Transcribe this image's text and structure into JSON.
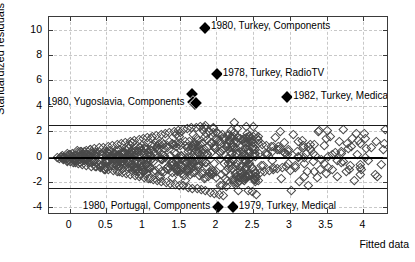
{
  "figure": {
    "title": "",
    "background": "#ffffff"
  },
  "axes": {
    "xlabel": "Fitted data",
    "ylabel": "Standardized residuals",
    "xlim": [
      -0.28,
      4.35
    ],
    "ylim": [
      -4.6,
      11.0
    ],
    "xticks": [
      0,
      0.5,
      1,
      1.5,
      2,
      2.5,
      3,
      3.5,
      4
    ],
    "xticklabels": [
      "0",
      "0.5",
      "1",
      "1.5",
      "2",
      "2.5",
      "3",
      "3.5",
      "4"
    ],
    "yticks": [
      -4,
      -2,
      0,
      2,
      4,
      6,
      8,
      10
    ],
    "yticklabels": [
      "-4",
      "-2",
      "0",
      "2",
      "4",
      "6",
      "8",
      "10"
    ],
    "grid": true,
    "grid_style": "dashed",
    "grid_color": "#c8c8c8",
    "frame_color": "#3a3a3a"
  },
  "reference_lines": [
    {
      "name": "upper-threshold",
      "y": 2.5,
      "color": "#1a1a1a",
      "width": 1
    },
    {
      "name": "zero-line",
      "y": 0,
      "color": "#000000",
      "width": 2.4
    },
    {
      "name": "lower-threshold",
      "y": -2.5,
      "color": "#1a1a1a",
      "width": 1
    }
  ],
  "annotations": [
    {
      "id": "a1",
      "text": "1980, Turkey, Components",
      "x": 1.83,
      "y": 10.25,
      "marker": "filled-diamond",
      "label_side": "right"
    },
    {
      "id": "a2",
      "text": "1978, Turkey, RadioTV",
      "x": 1.99,
      "y": 6.55,
      "marker": "filled-diamond",
      "label_side": "right"
    },
    {
      "id": "a3",
      "text": "1982, Turkey, Medical",
      "x": 2.95,
      "y": 4.75,
      "marker": "filled-diamond",
      "label_side": "right"
    },
    {
      "id": "a4",
      "text": "1980, Yugoslavia, Components",
      "x": 1.66,
      "y": 4.3,
      "marker": "none",
      "label_side": "left"
    },
    {
      "id": "a5",
      "text": "1980, Portugal, Components",
      "x": 2.01,
      "y": -3.9,
      "marker": "filled-diamond",
      "label_side": "left"
    },
    {
      "id": "a6",
      "text": "1979, Turkey, Medical",
      "x": 2.21,
      "y": -3.9,
      "marker": "filled-diamond",
      "label_side": "right"
    }
  ],
  "chart_data": {
    "type": "scatter",
    "title": "",
    "xlabel": "Fitted data",
    "ylabel": "Standardized residuals",
    "xlim": [
      -0.28,
      4.35
    ],
    "ylim": [
      -4.6,
      11.0
    ],
    "grid": true,
    "legend": null,
    "marker": "open-diamond",
    "marker_color": "#4a4a4a",
    "series": [
      {
        "name": "residuals",
        "description": "Standardized residuals versus fitted data; dense funnel-shaped cloud widening with fitted value, centered on zero, bounded mostly within +/-2.5, with six labelled outliers.",
        "n_points_approx": 620,
        "highlighted_points": [
          {
            "x": 1.83,
            "y": 10.25,
            "label": "1980, Turkey, Components"
          },
          {
            "x": 1.99,
            "y": 6.55,
            "label": "1978, Turkey, RadioTV"
          },
          {
            "x": 2.95,
            "y": 4.75,
            "label": "1982, Turkey, Medical"
          },
          {
            "x": 1.66,
            "y": 5.0,
            "label": "1980, Yugoslavia, Components"
          },
          {
            "x": 1.67,
            "y": 4.3,
            "label": "1980, Yugoslavia, Components"
          },
          {
            "x": 1.69,
            "y": 4.2,
            "label": "1980, Yugoslavia, Components"
          },
          {
            "x": 2.01,
            "y": -3.9,
            "label": "1980, Portugal, Components"
          },
          {
            "x": 2.21,
            "y": -3.9,
            "label": "1979, Turkey, Medical"
          }
        ],
        "points": [
          [
            -0.18,
            0.02
          ],
          [
            -0.15,
            -0.05
          ],
          [
            -0.12,
            0.1
          ],
          [
            -0.1,
            -0.12
          ],
          [
            -0.08,
            0.06
          ],
          [
            -0.05,
            0.18
          ],
          [
            -0.04,
            -0.2
          ],
          [
            -0.02,
            0.25
          ],
          [
            0.0,
            -0.28
          ],
          [
            0.01,
            0.12
          ],
          [
            0.03,
            0.33
          ],
          [
            0.04,
            -0.35
          ],
          [
            0.06,
            0.08
          ],
          [
            0.07,
            -0.18
          ],
          [
            0.09,
            0.4
          ],
          [
            0.1,
            -0.42
          ],
          [
            0.12,
            0.22
          ],
          [
            0.13,
            -0.1
          ],
          [
            0.15,
            0.48
          ],
          [
            0.16,
            -0.5
          ],
          [
            0.18,
            0.3
          ],
          [
            0.19,
            -0.25
          ],
          [
            0.21,
            0.55
          ],
          [
            0.22,
            -0.58
          ],
          [
            0.24,
            0.15
          ],
          [
            0.25,
            -0.33
          ],
          [
            0.27,
            0.62
          ],
          [
            0.28,
            -0.65
          ],
          [
            0.3,
            0.38
          ],
          [
            0.31,
            -0.2
          ],
          [
            0.33,
            0.7
          ],
          [
            0.34,
            -0.72
          ],
          [
            0.36,
            0.45
          ],
          [
            0.37,
            -0.4
          ],
          [
            0.39,
            0.78
          ],
          [
            0.4,
            -0.8
          ],
          [
            0.42,
            0.28
          ],
          [
            0.43,
            -0.55
          ],
          [
            0.45,
            0.85
          ],
          [
            0.46,
            -0.88
          ],
          [
            0.48,
            0.52
          ],
          [
            0.49,
            -0.3
          ],
          [
            0.51,
            0.92
          ],
          [
            0.52,
            -0.95
          ],
          [
            0.54,
            0.6
          ],
          [
            0.55,
            -0.62
          ],
          [
            0.57,
            1.0
          ],
          [
            0.58,
            -1.02
          ],
          [
            0.6,
            0.35
          ],
          [
            0.61,
            -0.45
          ],
          [
            0.63,
            1.08
          ],
          [
            0.64,
            -1.1
          ],
          [
            0.66,
            0.68
          ],
          [
            0.67,
            -0.7
          ],
          [
            0.69,
            1.15
          ],
          [
            0.7,
            -1.18
          ],
          [
            0.72,
            0.42
          ],
          [
            0.73,
            -0.52
          ],
          [
            0.75,
            1.22
          ],
          [
            0.76,
            -1.25
          ],
          [
            0.78,
            0.75
          ],
          [
            0.79,
            -0.78
          ],
          [
            0.81,
            1.3
          ],
          [
            0.82,
            -1.32
          ],
          [
            0.84,
            0.5
          ],
          [
            0.85,
            -0.6
          ],
          [
            0.87,
            1.38
          ],
          [
            0.88,
            -1.4
          ],
          [
            0.9,
            0.82
          ],
          [
            0.91,
            -0.85
          ],
          [
            0.93,
            1.45
          ],
          [
            0.94,
            -1.48
          ],
          [
            0.96,
            0.58
          ],
          [
            0.97,
            -0.68
          ],
          [
            0.99,
            1.52
          ],
          [
            1.0,
            -1.55
          ],
          [
            1.02,
            0.9
          ],
          [
            1.03,
            -0.92
          ],
          [
            1.05,
            1.6
          ],
          [
            1.06,
            -1.62
          ],
          [
            1.08,
            0.65
          ],
          [
            1.09,
            -0.75
          ],
          [
            1.11,
            1.68
          ],
          [
            1.12,
            -1.7
          ],
          [
            1.14,
            0.98
          ],
          [
            1.15,
            -1.0
          ],
          [
            1.17,
            1.75
          ],
          [
            1.18,
            -1.78
          ],
          [
            1.2,
            0.72
          ],
          [
            1.21,
            -0.82
          ],
          [
            1.23,
            1.82
          ],
          [
            1.24,
            -1.85
          ],
          [
            1.26,
            1.05
          ],
          [
            1.27,
            -1.08
          ],
          [
            1.29,
            1.9
          ],
          [
            1.3,
            -1.92
          ],
          [
            1.32,
            0.8
          ],
          [
            1.33,
            -0.9
          ],
          [
            1.35,
            1.98
          ],
          [
            1.36,
            -2.0
          ],
          [
            1.38,
            1.12
          ],
          [
            1.39,
            -1.15
          ],
          [
            1.41,
            2.05
          ],
          [
            1.42,
            -2.08
          ],
          [
            1.44,
            0.88
          ],
          [
            1.45,
            -0.98
          ],
          [
            1.47,
            2.12
          ],
          [
            1.48,
            -2.15
          ],
          [
            1.5,
            1.2
          ],
          [
            1.51,
            -1.22
          ],
          [
            1.53,
            2.2
          ],
          [
            1.54,
            -2.22
          ],
          [
            1.56,
            0.95
          ],
          [
            1.57,
            -1.05
          ],
          [
            1.59,
            2.28
          ],
          [
            1.6,
            -2.3
          ],
          [
            1.62,
            1.28
          ],
          [
            1.63,
            -1.3
          ],
          [
            1.65,
            2.35
          ],
          [
            1.66,
            -2.38
          ],
          [
            1.68,
            1.02
          ],
          [
            1.69,
            -1.12
          ],
          [
            1.71,
            2.42
          ],
          [
            1.72,
            -2.45
          ],
          [
            1.74,
            1.35
          ],
          [
            1.75,
            -1.38
          ],
          [
            1.77,
            2.48
          ],
          [
            1.78,
            -2.52
          ],
          [
            1.8,
            1.1
          ],
          [
            1.81,
            -1.2
          ],
          [
            1.83,
            2.55
          ],
          [
            1.84,
            -2.6
          ],
          [
            1.86,
            1.42
          ],
          [
            1.87,
            -1.45
          ],
          [
            1.89,
            2.1
          ],
          [
            1.9,
            -2.7
          ],
          [
            1.92,
            1.18
          ],
          [
            1.93,
            -1.28
          ],
          [
            1.95,
            2.0
          ],
          [
            1.96,
            -2.8
          ],
          [
            1.98,
            1.5
          ],
          [
            1.99,
            -1.52
          ],
          [
            2.01,
            1.92
          ],
          [
            2.02,
            -2.9
          ],
          [
            2.04,
            1.25
          ],
          [
            2.05,
            -1.35
          ],
          [
            2.07,
            1.85
          ],
          [
            2.08,
            -3.0
          ],
          [
            2.1,
            1.58
          ],
          [
            2.11,
            -1.6
          ],
          [
            2.13,
            1.78
          ],
          [
            2.14,
            -1.82
          ],
          [
            2.16,
            1.32
          ],
          [
            2.17,
            -1.42
          ],
          [
            2.19,
            1.7
          ],
          [
            2.2,
            -1.72
          ],
          [
            2.22,
            1.65
          ],
          [
            2.23,
            -1.68
          ],
          [
            2.25,
            1.4
          ],
          [
            2.26,
            -1.5
          ],
          [
            2.28,
            1.62
          ],
          [
            2.29,
            -2.55
          ],
          [
            2.31,
            1.55
          ],
          [
            2.32,
            -1.58
          ],
          [
            2.34,
            1.48
          ],
          [
            2.35,
            -1.55
          ],
          [
            2.37,
            1.52
          ],
          [
            2.38,
            -1.62
          ],
          [
            2.4,
            1.45
          ],
          [
            2.41,
            -1.48
          ],
          [
            2.43,
            1.38
          ],
          [
            2.44,
            -1.4
          ],
          [
            2.46,
            1.3
          ],
          [
            2.47,
            -1.32
          ],
          [
            2.49,
            1.22
          ],
          [
            2.52,
            -1.25
          ],
          [
            2.55,
            1.15
          ],
          [
            2.58,
            -1.18
          ],
          [
            2.61,
            1.08
          ],
          [
            2.64,
            -1.1
          ],
          [
            2.67,
            1.0
          ],
          [
            2.7,
            -1.02
          ],
          [
            2.73,
            0.92
          ],
          [
            2.76,
            -0.95
          ],
          [
            2.79,
            1.6
          ],
          [
            2.82,
            -0.88
          ],
          [
            2.85,
            2.05
          ],
          [
            2.88,
            -0.8
          ],
          [
            2.91,
            1.2
          ],
          [
            2.94,
            -0.72
          ],
          [
            2.97,
            0.65
          ],
          [
            3.0,
            -2.55
          ],
          [
            3.03,
            1.85
          ],
          [
            3.06,
            -0.58
          ],
          [
            3.09,
            0.5
          ],
          [
            3.12,
            -1.9
          ],
          [
            3.15,
            1.4
          ],
          [
            3.18,
            -0.42
          ],
          [
            3.21,
            0.35
          ],
          [
            3.24,
            -2.2
          ],
          [
            3.27,
            1.05
          ],
          [
            3.3,
            -0.28
          ],
          [
            3.33,
            0.2
          ],
          [
            3.36,
            -1.55
          ],
          [
            3.39,
            2.15
          ],
          [
            3.42,
            -0.15
          ],
          [
            3.45,
            0.95
          ],
          [
            3.48,
            -1.2
          ],
          [
            3.51,
            0.08
          ],
          [
            3.54,
            1.7
          ],
          [
            3.57,
            -0.9
          ],
          [
            3.6,
            0.45
          ],
          [
            3.63,
            -1.45
          ],
          [
            3.66,
            1.25
          ],
          [
            3.69,
            -0.35
          ],
          [
            3.72,
            2.25
          ],
          [
            3.75,
            -1.05
          ],
          [
            3.78,
            0.7
          ],
          [
            3.81,
            -0.62
          ],
          [
            3.84,
            1.55
          ],
          [
            3.87,
            -1.75
          ],
          [
            3.9,
            0.3
          ],
          [
            3.95,
            -0.5
          ],
          [
            4.0,
            1.9
          ],
          [
            4.05,
            -0.25
          ],
          [
            4.1,
            0.85
          ],
          [
            4.15,
            -1.35
          ]
        ]
      }
    ]
  }
}
